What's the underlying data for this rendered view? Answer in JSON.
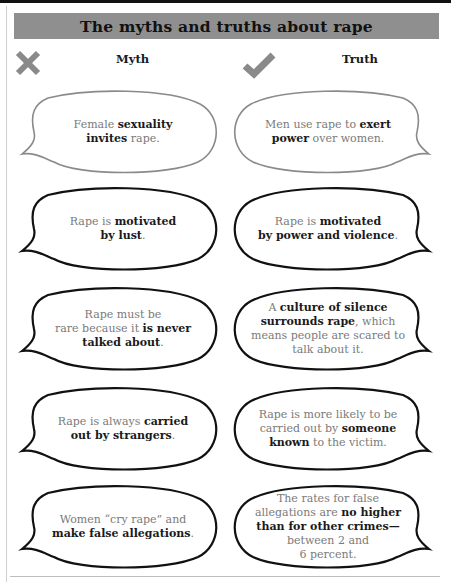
{
  "title": "The myths and truths about rape",
  "columns": {
    "myth": {
      "label": "Myth",
      "icon": "x-mark-icon"
    },
    "truth": {
      "label": "Truth",
      "icon": "check-mark-icon"
    }
  },
  "colors": {
    "title_bar": "#8f8f8f",
    "icon_gray": "#8a8a8a",
    "bold_text": "#1a1a1a",
    "regular_text": "#7a7a7a",
    "first_bubble_outline": "#8a8a8a",
    "bubble_outline": "#111111"
  },
  "rows": [
    {
      "myth": {
        "lines": [
          [
            {
              "t": "Female ",
              "b": false
            },
            {
              "t": "sexuality",
              "b": true
            }
          ],
          [
            {
              "t": "invites",
              "b": true
            },
            {
              "t": " rape.",
              "b": false
            }
          ]
        ],
        "plain": "Female sexuality invites rape."
      },
      "truth": {
        "lines": [
          [
            {
              "t": "Men use rape to ",
              "b": false
            },
            {
              "t": "exert",
              "b": true
            }
          ],
          [
            {
              "t": "power",
              "b": true
            },
            {
              "t": " over women.",
              "b": false
            }
          ]
        ],
        "plain": "Men use rape to exert power over women."
      }
    },
    {
      "myth": {
        "lines": [
          [
            {
              "t": "Rape is ",
              "b": false
            },
            {
              "t": "motivated",
              "b": true
            }
          ],
          [
            {
              "t": "by lust",
              "b": true
            },
            {
              "t": ".",
              "b": false
            }
          ]
        ],
        "plain": "Rape is motivated by lust."
      },
      "truth": {
        "lines": [
          [
            {
              "t": "Rape is ",
              "b": false
            },
            {
              "t": "motivated",
              "b": true
            }
          ],
          [
            {
              "t": "by power and violence",
              "b": true
            },
            {
              "t": ".",
              "b": false
            }
          ]
        ],
        "plain": "Rape is motivated by power and violence."
      }
    },
    {
      "myth": {
        "lines": [
          [
            {
              "t": "Rape must be",
              "b": false
            }
          ],
          [
            {
              "t": "rare because it ",
              "b": false
            },
            {
              "t": "is never",
              "b": true
            }
          ],
          [
            {
              "t": "talked about",
              "b": true
            },
            {
              "t": ".",
              "b": false
            }
          ]
        ],
        "plain": "Rape must be rare because it is never talked about."
      },
      "truth": {
        "lines": [
          [
            {
              "t": "A ",
              "b": false
            },
            {
              "t": "culture of silence",
              "b": true
            }
          ],
          [
            {
              "t": "surrounds rape",
              "b": true
            },
            {
              "t": ", which",
              "b": false
            }
          ],
          [
            {
              "t": "means people are scared to",
              "b": false
            }
          ],
          [
            {
              "t": "talk about it.",
              "b": false
            }
          ]
        ],
        "plain": "A culture of silence surrounds rape, which means people are scared to talk about it."
      }
    },
    {
      "myth": {
        "lines": [
          [
            {
              "t": "Rape is always ",
              "b": false
            },
            {
              "t": "carried",
              "b": true
            }
          ],
          [
            {
              "t": "out by strangers",
              "b": true
            },
            {
              "t": ".",
              "b": false
            }
          ]
        ],
        "plain": "Rape is always carried out by strangers."
      },
      "truth": {
        "lines": [
          [
            {
              "t": "Rape is more likely to be",
              "b": false
            }
          ],
          [
            {
              "t": "carried out by ",
              "b": false
            },
            {
              "t": "someone",
              "b": true
            }
          ],
          [
            {
              "t": "known",
              "b": true
            },
            {
              "t": " to the victim.",
              "b": false
            }
          ]
        ],
        "plain": "Rape is more likely to be carried out by someone known to the victim."
      }
    },
    {
      "myth": {
        "lines": [
          [
            {
              "t": "Women “cry rape” and",
              "b": false
            }
          ],
          [
            {
              "t": "make false allegations",
              "b": true
            },
            {
              "t": ".",
              "b": false
            }
          ]
        ],
        "plain": "Women “cry rape” and make false allegations."
      },
      "truth": {
        "lines": [
          [
            {
              "t": "The rates for false",
              "b": false
            }
          ],
          [
            {
              "t": "allegations are ",
              "b": false
            },
            {
              "t": "no higher",
              "b": true
            }
          ],
          [
            {
              "t": "than for other crimes—",
              "b": true
            }
          ],
          [
            {
              "t": "between 2 and",
              "b": false
            }
          ],
          [
            {
              "t": "6 percent.",
              "b": false
            }
          ]
        ],
        "plain": "The rates for false allegations are no higher than for other crimes—between 2 and 6 percent."
      }
    }
  ]
}
